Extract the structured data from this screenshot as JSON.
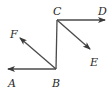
{
  "diagram": {
    "type": "vector-geometry",
    "stroke_color": "#4a4a4a",
    "points": {
      "A": {
        "label": "A",
        "x": 8,
        "y": 69,
        "label_x": 8,
        "label_y": 87
      },
      "B": {
        "label": "B",
        "x": 56,
        "y": 69,
        "label_x": 52,
        "label_y": 87
      },
      "C": {
        "label": "C",
        "x": 57,
        "y": 20,
        "label_x": 53,
        "label_y": 15
      },
      "D": {
        "label": "D",
        "x": 105,
        "y": 20,
        "label_x": 98,
        "label_y": 15
      },
      "E": {
        "label": "E",
        "x": 90,
        "y": 49,
        "label_x": 90,
        "label_y": 66
      },
      "F": {
        "label": "F",
        "x": 20,
        "y": 38,
        "label_x": 10,
        "label_y": 38
      }
    },
    "segments": [
      {
        "from": "B",
        "to": "A",
        "arrow": true
      },
      {
        "from": "B",
        "to": "C",
        "arrow": false
      },
      {
        "from": "C",
        "to": "D",
        "arrow": true
      },
      {
        "from": "C",
        "to": "E",
        "arrow": true
      },
      {
        "from": "B",
        "to": "F",
        "arrow": true
      }
    ]
  }
}
